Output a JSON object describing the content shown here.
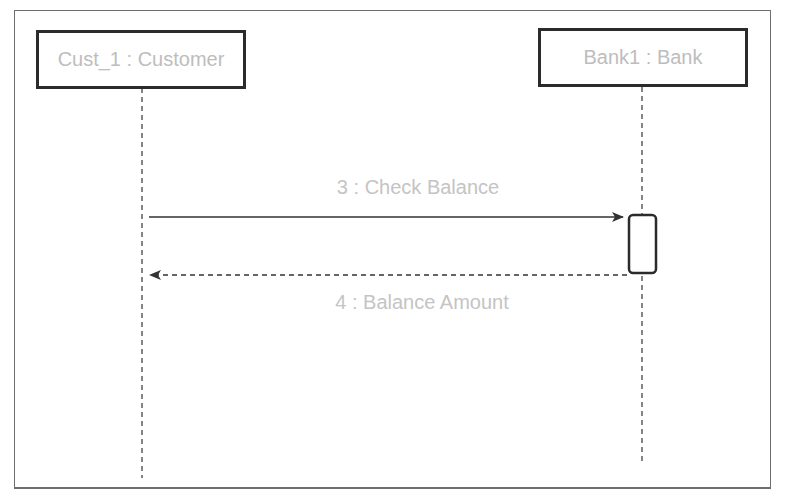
{
  "diagram": {
    "type": "UML sequence diagram",
    "lifelines": [
      {
        "id": "customer",
        "label": "Cust_1 : Customer"
      },
      {
        "id": "bank",
        "label": "Bank1 : Bank"
      }
    ],
    "messages": [
      {
        "number": 3,
        "label": "3 : Check Balance",
        "from": "customer",
        "to": "bank",
        "kind": "synchronous"
      },
      {
        "number": 4,
        "label": "4 : Balance Amount",
        "from": "bank",
        "to": "customer",
        "kind": "return"
      }
    ],
    "colors": {
      "border": "#2b2b2b",
      "text": "#bdbdbd",
      "line": "#333333"
    }
  }
}
